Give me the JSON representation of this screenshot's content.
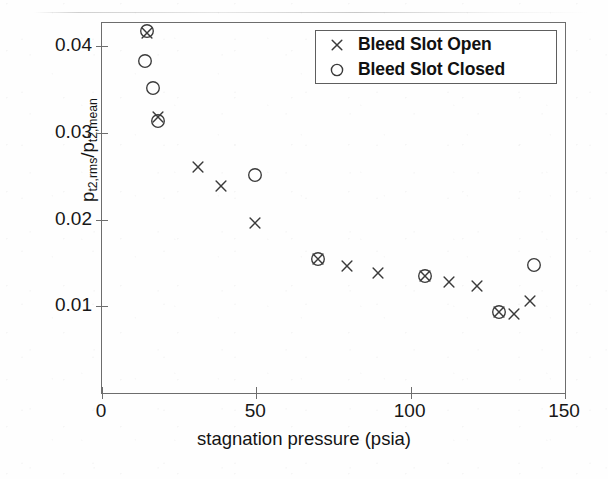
{
  "chart_data": {
    "type": "scatter",
    "title": "",
    "xlabel": "stagnation pressure (psia)",
    "ylabel": "p_t2,rms / p_t2,mean",
    "ylabel_parts": {
      "num_base": "p",
      "num_sub": "t2,rms",
      "slash": "/",
      "den_base": "p",
      "den_sub": "t2,mean"
    },
    "xlim": [
      0,
      150
    ],
    "ylim": [
      0,
      0.0427
    ],
    "xticks": [
      0,
      50,
      100,
      150
    ],
    "xtick_labels": [
      "0",
      "50",
      "100",
      "150"
    ],
    "yticks": [
      0.01,
      0.02,
      0.03,
      0.04
    ],
    "ytick_labels": [
      "0.01",
      "0.02",
      "0.03",
      "0.04"
    ],
    "grid": false,
    "legend_position": "upper right",
    "marker_color": "#3a3a3a",
    "axis_color": "#6d6d6d",
    "series": [
      {
        "name": "Bleed Slot Open",
        "marker": "x",
        "points": [
          {
            "x": 14.5,
            "y": 0.0416
          },
          {
            "x": 18.0,
            "y": 0.0319
          },
          {
            "x": 31.0,
            "y": 0.0261
          },
          {
            "x": 38.5,
            "y": 0.0239
          },
          {
            "x": 49.5,
            "y": 0.0196
          },
          {
            "x": 70.0,
            "y": 0.0155
          },
          {
            "x": 79.5,
            "y": 0.0146
          },
          {
            "x": 89.5,
            "y": 0.0139
          },
          {
            "x": 104.5,
            "y": 0.0135
          },
          {
            "x": 112.5,
            "y": 0.0128
          },
          {
            "x": 121.5,
            "y": 0.0124
          },
          {
            "x": 128.5,
            "y": 0.0094
          },
          {
            "x": 133.5,
            "y": 0.0091
          },
          {
            "x": 138.5,
            "y": 0.0106
          }
        ]
      },
      {
        "name": "Bleed Slot Closed",
        "marker": "o",
        "points": [
          {
            "x": 14.5,
            "y": 0.0418
          },
          {
            "x": 14.0,
            "y": 0.0383
          },
          {
            "x": 16.5,
            "y": 0.0352
          },
          {
            "x": 18.0,
            "y": 0.0314
          },
          {
            "x": 49.5,
            "y": 0.0252
          },
          {
            "x": 70.0,
            "y": 0.0155
          },
          {
            "x": 104.5,
            "y": 0.0135
          },
          {
            "x": 128.5,
            "y": 0.0094
          },
          {
            "x": 140.0,
            "y": 0.0148
          }
        ]
      }
    ],
    "legend_entries": [
      {
        "marker": "x",
        "label": "Bleed Slot Open"
      },
      {
        "marker": "o",
        "label": "Bleed Slot Closed"
      }
    ]
  }
}
